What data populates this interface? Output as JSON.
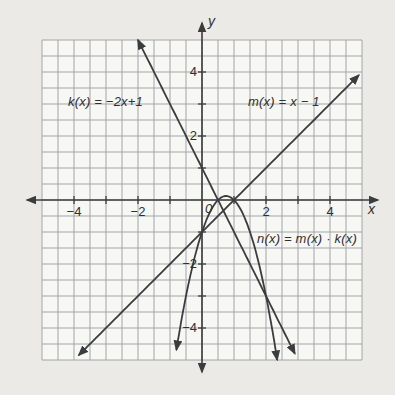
{
  "page": {
    "background_color": "#ebeae7",
    "grid_background_color": "#f7f7f4",
    "grid_line_color": "#a2a6aa",
    "ink_color": "#3b3c3e",
    "text_color": "#2f3032"
  },
  "graph": {
    "axis_labels": {
      "x": "x",
      "y": "y"
    },
    "origin_label": "0",
    "function_labels": {
      "k": "k(x) = −2x+1",
      "m": "m(x) = x − 1",
      "n": "n(x) = m(x) · k(x)"
    },
    "xtick_labels": [
      "−4",
      "−2",
      "2",
      "4"
    ],
    "ytick_labels": [
      "4",
      "2",
      "−2",
      "−4"
    ]
  },
  "chart_data": {
    "type": "line",
    "title": "",
    "xlabel": "x",
    "ylabel": "y",
    "xlim": [
      -5,
      5
    ],
    "ylim": [
      -5,
      5
    ],
    "grid": true,
    "grid_step": 0.5,
    "tick_step": 1,
    "labeled_xticks": [
      -4,
      -2,
      2,
      4
    ],
    "labeled_yticks": [
      4,
      2,
      -2,
      -4
    ],
    "legend_position": "labels-on-plot",
    "series": [
      {
        "name": "k",
        "label": "k(x) = −2x+1",
        "equation": "k(x) = -2x + 1",
        "coeffs": [
          1,
          -2
        ],
        "draw_domain": [
          -2,
          2.9
        ],
        "arrows": "both",
        "points": [
          [
            -2,
            5
          ],
          [
            -1,
            3
          ],
          [
            0,
            1
          ],
          [
            0.5,
            0
          ],
          [
            1,
            -1
          ],
          [
            2,
            -3
          ],
          [
            2.9,
            -4.8
          ]
        ]
      },
      {
        "name": "m",
        "label": "m(x) = x − 1",
        "equation": "m(x) = x - 1",
        "coeffs": [
          -1,
          1
        ],
        "draw_domain": [
          -3.85,
          4.9
        ],
        "arrows": "both",
        "points": [
          [
            -3.85,
            -4.85
          ],
          [
            -2,
            -3
          ],
          [
            0,
            -1
          ],
          [
            1,
            0
          ],
          [
            2,
            1
          ],
          [
            4,
            3
          ],
          [
            4.9,
            3.9
          ]
        ]
      },
      {
        "name": "n",
        "label": "n(x) = m(x) · k(x)",
        "equation": "n(x) = -2x^2 + 3x - 1",
        "coeffs": [
          -1,
          3,
          -2
        ],
        "draw_domain": [
          -0.8,
          2.35
        ],
        "arrows": "both",
        "vertex": [
          0.75,
          0.125
        ],
        "points": [
          [
            -0.8,
            -4.68
          ],
          [
            0,
            -1
          ],
          [
            0.5,
            0
          ],
          [
            0.75,
            0.125
          ],
          [
            1,
            0
          ],
          [
            2,
            -3
          ],
          [
            2.35,
            -5
          ]
        ]
      }
    ],
    "intersections_shown": [
      {
        "curves": [
          "k",
          "m"
        ],
        "point": [
          0.667,
          -0.333
        ]
      },
      {
        "curves": [
          "k",
          "n"
        ],
        "point": [
          2,
          -3
        ]
      },
      {
        "curves": [
          "m",
          "n"
        ],
        "point": [
          0,
          -1
        ]
      }
    ]
  }
}
